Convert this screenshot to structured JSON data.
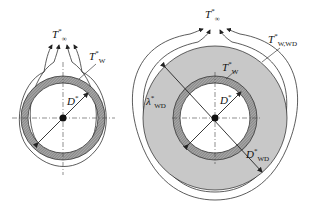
{
  "left_figure": {
    "labels": {
      "t_inf": {
        "base": "T",
        "sup": "*",
        "sub": "∞"
      },
      "t_w": {
        "base": "T",
        "sup": "*",
        "sub": "W"
      },
      "d": {
        "base": "D",
        "sup": "*",
        "sub": ""
      }
    }
  },
  "right_figure": {
    "labels": {
      "t_inf": {
        "base": "T",
        "sup": "*",
        "sub": "∞"
      },
      "t_w_wd": {
        "base": "T",
        "sup": "*",
        "sub": "W,WD"
      },
      "t_w": {
        "base": "T",
        "sup": "*",
        "sub": "W"
      },
      "lambda_wd": {
        "base": "λ",
        "sup": "*",
        "sub": "WD"
      },
      "d": {
        "base": "D",
        "sup": "*",
        "sub": ""
      },
      "d_wd": {
        "base": "D",
        "sup": "*",
        "sub": "WD"
      }
    }
  },
  "colors": {
    "deposit_fill": "#c8c8c8",
    "wall_hatch": "#8a8a8a",
    "line": "#222222"
  }
}
